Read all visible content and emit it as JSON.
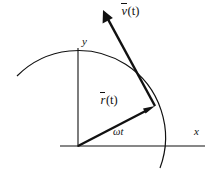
{
  "figure": {
    "kind": "vector-diagram",
    "background_color": "#ffffff",
    "stroke_color": "#111111",
    "axes": {
      "x_label": "x",
      "y_label": "y",
      "origin": [
        78,
        146
      ],
      "x_axis_end": [
        205,
        146
      ],
      "y_axis_end": [
        78,
        48
      ]
    },
    "arc": {
      "name": "circular-path-arc",
      "center": [
        78,
        146
      ],
      "radius": 87,
      "start_point": [
        17,
        76
      ],
      "end_point": [
        160,
        168
      ]
    },
    "vectors": [
      {
        "name": "position-vector",
        "label_symbol": "r",
        "label_argument": "(t)",
        "from": [
          78,
          146
        ],
        "to": [
          155,
          106
        ],
        "label_position": [
          101,
          95
        ]
      },
      {
        "name": "velocity-vector",
        "label_symbol": "v",
        "label_argument": "(t)",
        "from": [
          155,
          106
        ],
        "to": [
          103,
          10
        ],
        "label_position": [
          122,
          6
        ]
      }
    ],
    "angle": {
      "name": "omega-t-angle",
      "label": "ωt",
      "symbol": "ω",
      "variable": "t",
      "position": [
        113,
        127
      ]
    }
  }
}
